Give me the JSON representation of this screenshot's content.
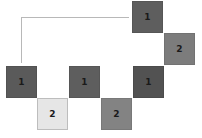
{
  "diagram": {
    "tiles": [
      {
        "label": "1",
        "color": "#5e5e5e"
      },
      {
        "label": "2",
        "color": "#7c7c7c"
      },
      {
        "label": "1",
        "color": "#5a5a5a"
      },
      {
        "label": "2",
        "color": "#e6e6e6"
      },
      {
        "label": "1",
        "color": "#5e5e5e"
      },
      {
        "label": "2",
        "color": "#838383"
      },
      {
        "label": "1",
        "color": "#525252"
      }
    ],
    "connector_color": "#b8b8b8"
  }
}
